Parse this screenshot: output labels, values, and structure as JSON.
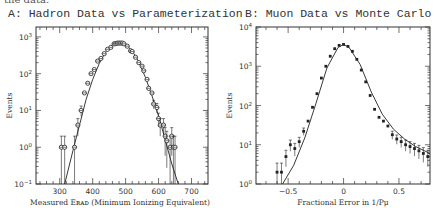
{
  "page": {
    "cut_text": "the data."
  },
  "chart_data": [
    {
      "type": "scatter",
      "title": "A: Hadron Data vs Parameterization",
      "xlabel": "Measured E_RAD (Minimum Ionizing Equivalent)",
      "ylabel": "Events",
      "yscale": "log",
      "xlim": [
        228,
        750
      ],
      "ylim": [
        0.1,
        1000
      ],
      "xticks": [
        300,
        400,
        500,
        600,
        700
      ],
      "yticks": [
        "10^-1",
        "10^0",
        "10^1",
        "10^2",
        "10^3"
      ],
      "series": [
        {
          "name": "Data (with error bars)",
          "x": [
            305,
            315,
            345,
            355,
            365,
            375,
            385,
            395,
            405,
            415,
            425,
            435,
            445,
            455,
            465,
            470,
            475,
            480,
            485,
            490,
            495,
            505,
            515,
            520,
            530,
            540,
            550,
            555,
            565,
            570,
            580,
            585,
            595,
            600,
            605,
            615,
            620,
            625,
            635,
            640,
            645,
            650
          ],
          "y": [
            1,
            1,
            1,
            4,
            10,
            30,
            55,
            100,
            130,
            220,
            260,
            350,
            460,
            520,
            650,
            660,
            680,
            680,
            680,
            680,
            650,
            560,
            420,
            400,
            280,
            200,
            160,
            120,
            70,
            40,
            30,
            15,
            12,
            6,
            4,
            4,
            2,
            1.5,
            1,
            2,
            1,
            1
          ]
        },
        {
          "name": "Parameterization (curve)",
          "x": [
            315,
            340,
            360,
            380,
            400,
            420,
            440,
            460,
            480,
            500,
            520,
            540,
            560,
            580,
            600,
            620,
            640,
            660
          ],
          "y": [
            0.1,
            0.8,
            4,
            20,
            70,
            190,
            400,
            620,
            690,
            620,
            420,
            210,
            80,
            25,
            7,
            1.6,
            0.35,
            0.1
          ]
        }
      ]
    },
    {
      "type": "scatter",
      "title": "B: Muon Data vs Monte Carlo",
      "xlabel": "Fractional Error in 1/P_μ",
      "ylabel": "Events",
      "yscale": "log",
      "xlim": [
        -0.79,
        0.78
      ],
      "ylim": [
        1,
        10000
      ],
      "xticks": [
        "-0.5",
        "0",
        "0.5"
      ],
      "yticks": [
        "10^0",
        "10^1",
        "10^2",
        "10^3",
        "10^4"
      ],
      "series": [
        {
          "name": "Muon Data (with error bars)",
          "x": [
            -0.6,
            -0.56,
            -0.52,
            -0.48,
            -0.44,
            -0.4,
            -0.36,
            -0.32,
            -0.28,
            -0.24,
            -0.2,
            -0.16,
            -0.12,
            -0.08,
            -0.04,
            0,
            0.04,
            0.08,
            0.12,
            0.16,
            0.2,
            0.24,
            0.28,
            0.32,
            0.36,
            0.4,
            0.44,
            0.48,
            0.52,
            0.56,
            0.6,
            0.64,
            0.68,
            0.72,
            0.76
          ],
          "y": [
            2,
            2,
            5,
            10,
            8,
            12,
            22,
            40,
            90,
            200,
            500,
            1000,
            1800,
            2800,
            3400,
            3600,
            3200,
            2400,
            1500,
            800,
            400,
            180,
            80,
            50,
            40,
            30,
            18,
            14,
            12,
            10,
            9,
            8,
            7,
            6,
            5
          ]
        },
        {
          "name": "Monte Carlo (curve)",
          "x": [
            -0.55,
            -0.45,
            -0.35,
            -0.25,
            -0.15,
            -0.05,
            0,
            0.05,
            0.15,
            0.25,
            0.35,
            0.45,
            0.55,
            0.65,
            0.78
          ],
          "y": [
            1,
            3,
            15,
            110,
            900,
            3000,
            3600,
            3000,
            1100,
            220,
            60,
            25,
            14,
            9,
            6
          ]
        }
      ]
    }
  ]
}
